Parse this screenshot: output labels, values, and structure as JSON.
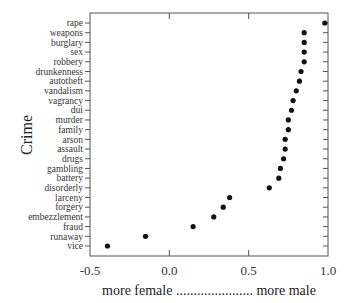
{
  "chart_data": {
    "type": "scatter",
    "title": "",
    "xlabel": "more female ...................... more male",
    "ylabel": "Crime",
    "xlim": [
      -0.5,
      1.0
    ],
    "xticks": [
      -0.5,
      0.0,
      0.5,
      1.0
    ],
    "xtick_labels": [
      "-0.5",
      "0.0",
      "0.5",
      "1.0"
    ],
    "grid": false,
    "legend": null,
    "categories": [
      "rape",
      "weapons",
      "burglary",
      "sex",
      "robbery",
      "drunkenness",
      "autotheft",
      "vandalism",
      "vagrancy",
      "dui",
      "murder",
      "family",
      "arson",
      "assault",
      "drugs",
      "gambling",
      "battery",
      "disorderly",
      "larceny",
      "forgery",
      "embezzlement",
      "fraud",
      "runaway",
      "vice"
    ],
    "values": [
      0.98,
      0.85,
      0.85,
      0.85,
      0.85,
      0.83,
      0.82,
      0.8,
      0.78,
      0.77,
      0.75,
      0.75,
      0.73,
      0.73,
      0.72,
      0.7,
      0.69,
      0.63,
      0.38,
      0.34,
      0.28,
      0.15,
      -0.15,
      -0.39
    ]
  }
}
